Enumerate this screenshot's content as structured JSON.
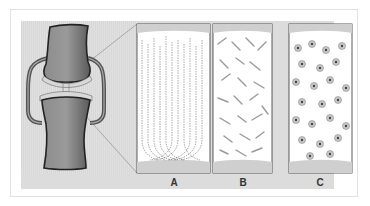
{
  "figure": {
    "panels": [
      {
        "id": "A",
        "label": "A",
        "tissue": "hyaline-like vertical fiber pattern"
      },
      {
        "id": "B",
        "label": "B",
        "tissue": "fibrous/interwoven collagen pattern"
      },
      {
        "id": "C",
        "label": "C",
        "tissue": "cellular pattern with chondrocytes"
      }
    ]
  },
  "colors": {
    "background": "#ffffff",
    "panel_bg": "#dcdcdc",
    "bone": "#7a7a7a",
    "outline": "#333333"
  }
}
